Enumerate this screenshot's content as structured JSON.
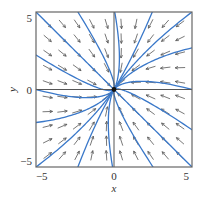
{
  "chart_data": {
    "type": "vector_field_phase_portrait",
    "title": "",
    "xlabel": "x",
    "ylabel": "y",
    "xlim": [
      -5.4,
      5.4
    ],
    "ylim": [
      -5.4,
      5.4
    ],
    "xticks": [
      -5,
      0,
      5
    ],
    "yticks": [
      -5,
      0,
      5
    ],
    "xtick_labels": [
      "−5",
      "0",
      "5"
    ],
    "ytick_labels": [
      "−5",
      "0",
      "5"
    ],
    "grid": false,
    "axes_through_origin": true,
    "equilibrium": {
      "x": 0,
      "y": 0,
      "type": "stable node"
    },
    "field": {
      "description": "Linear system with eigenvectors v1=(1,-1), v2=(1,1.6); eigenvalues -1.6 (fast) and -1 (slow)",
      "eigen": [
        {
          "vector": [
            1,
            -1
          ],
          "value": -1.6
        },
        {
          "vector": [
            1,
            1.6
          ],
          "value": -1.0
        }
      ],
      "arrow_grid": {
        "start": -4.6,
        "step": 1.02,
        "count": 10,
        "arrow_length_px": 10
      }
    },
    "trajectories": {
      "color": "#3a78c9",
      "start_points": [
        [
          -5.4,
          5.4
        ],
        [
          -2.5,
          5.4
        ],
        [
          0.05,
          5.4
        ],
        [
          2.65,
          5.4
        ],
        [
          5.4,
          5.4
        ],
        [
          5.4,
          2.9
        ],
        [
          5.4,
          0.0
        ],
        [
          5.4,
          -2.8
        ],
        [
          5.4,
          -5.4
        ],
        [
          2.7,
          -5.4
        ],
        [
          -0.1,
          -5.4
        ],
        [
          -2.5,
          -5.4
        ],
        [
          -5.4,
          -5.4
        ],
        [
          -5.4,
          -2.3
        ],
        [
          -5.4,
          0.0
        ],
        [
          -5.4,
          2.4
        ]
      ]
    }
  },
  "colors": {
    "trajectory": "#3a78c9",
    "arrow": "#555555",
    "axis": "#555555",
    "frame": "#666666",
    "equilibrium": "#111111"
  }
}
